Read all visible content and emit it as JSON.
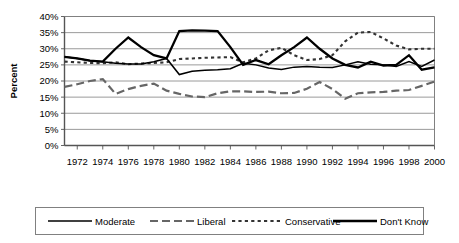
{
  "chart_data": {
    "type": "line",
    "title": "",
    "xlabel": "",
    "ylabel": "Percent",
    "ylim": [
      0,
      40
    ],
    "ytick_labels": [
      "0%",
      "5%",
      "10%",
      "15%",
      "20%",
      "25%",
      "30%",
      "35%",
      "40%"
    ],
    "ytick_values": [
      0,
      5,
      10,
      15,
      20,
      25,
      30,
      35,
      40
    ],
    "xtick_labels": [
      "1972",
      "1974",
      "1976",
      "1978",
      "1980",
      "1982",
      "1984",
      "1986",
      "1988",
      "1990",
      "1992",
      "1994",
      "1996",
      "1998",
      "2000"
    ],
    "xlim": [
      1972,
      2001
    ],
    "grid": true,
    "legend_position": "bottom",
    "x": [
      1972,
      1973,
      1974,
      1975,
      1976,
      1977,
      1978,
      1979,
      1980,
      1981,
      1982,
      1983,
      1984,
      1985,
      1986,
      1987,
      1988,
      1989,
      1990,
      1991,
      1992,
      1993,
      1994,
      1995,
      1996,
      1997,
      1998,
      1999,
      2000,
      2001
    ],
    "series": [
      {
        "name": "Moderate",
        "style": "solid-thin",
        "color": "#000000",
        "values": [
          27.5,
          27.0,
          26.3,
          26.0,
          25.5,
          25.3,
          25.3,
          26.0,
          27.0,
          22.0,
          23.0,
          23.3,
          23.5,
          23.8,
          25.5,
          25.0,
          24.0,
          23.6,
          24.3,
          24.5,
          24.3,
          24.2,
          25.0,
          26.0,
          25.2,
          25.0,
          24.5,
          26.0,
          24.5,
          26.5
        ]
      },
      {
        "name": "Liberal",
        "style": "long-dash",
        "color": "#666666",
        "values": [
          18.2,
          19.0,
          20.0,
          20.6,
          16.0,
          17.5,
          18.5,
          19.2,
          17.0,
          16.0,
          15.2,
          15.0,
          16.2,
          16.8,
          16.8,
          16.6,
          16.7,
          16.2,
          16.3,
          17.6,
          19.7,
          17.5,
          14.5,
          16.2,
          16.5,
          16.6,
          17.0,
          17.2,
          18.5,
          19.8
        ]
      },
      {
        "name": "Conservative",
        "style": "dotted",
        "color": "#333333",
        "values": [
          26.0,
          25.8,
          25.6,
          25.5,
          25.8,
          25.2,
          25.4,
          25.6,
          25.8,
          26.8,
          27.0,
          27.2,
          27.3,
          27.4,
          25.8,
          27.0,
          29.5,
          30.3,
          28.0,
          26.5,
          26.8,
          28.0,
          32.3,
          35.0,
          35.2,
          33.2,
          31.0,
          29.8,
          30.0,
          30.0
        ]
      },
      {
        "name": "Don't Know",
        "style": "solid-thick",
        "color": "#000000",
        "values": [
          27.5,
          27.0,
          26.3,
          26.0,
          30.0,
          33.5,
          30.5,
          28.0,
          27.0,
          35.5,
          35.7,
          35.6,
          35.5,
          30.5,
          25.0,
          26.5,
          25.2,
          28.0,
          30.5,
          33.5,
          30.0,
          27.0,
          25.0,
          24.2,
          26.0,
          24.8,
          25.0,
          28.0,
          23.5,
          24.2
        ]
      }
    ]
  },
  "legend": {
    "items": [
      {
        "label": "Moderate",
        "style": "solid-thin"
      },
      {
        "label": "Liberal",
        "style": "long-dash"
      },
      {
        "label": "Conservative",
        "style": "dotted"
      },
      {
        "label": "Don't Know",
        "style": "solid-thick"
      }
    ]
  }
}
